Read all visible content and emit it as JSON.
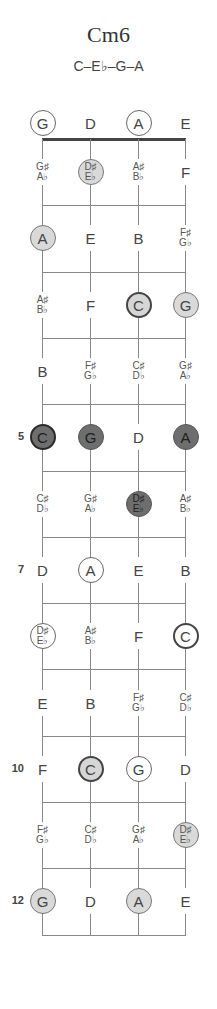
{
  "chord": {
    "name": "Cm6",
    "notes": "C–E♭–G–A"
  },
  "layout": {
    "string_x": [
      42,
      90,
      138,
      185
    ],
    "nut_y": 139,
    "fret_spacing": 66.3,
    "open_y": 123,
    "frets": 12
  },
  "colors": {
    "light_marker": "#d9d9d9",
    "dark_marker": "#6e6e6e",
    "line": "#888888",
    "nut": "#444444"
  },
  "fret_markers": [
    {
      "fret": 5,
      "label": "5"
    },
    {
      "fret": 7,
      "label": "7"
    },
    {
      "fret": 10,
      "label": "10"
    },
    {
      "fret": 12,
      "label": "12"
    }
  ],
  "rows": [
    {
      "fret": 0,
      "cells": [
        {
          "top": "G",
          "style": "open-ring"
        },
        {
          "top": "D",
          "style": "plain"
        },
        {
          "top": "A",
          "style": "open-ring"
        },
        {
          "top": "E",
          "style": "plain"
        }
      ]
    },
    {
      "fret": 1,
      "cells": [
        {
          "top": "G♯",
          "bottom": "A♭",
          "style": "plain"
        },
        {
          "top": "D♯",
          "bottom": "E♭",
          "style": "light"
        },
        {
          "top": "A♯",
          "bottom": "B♭",
          "style": "plain"
        },
        {
          "top": "F",
          "style": "plain"
        }
      ]
    },
    {
      "fret": 2,
      "cells": [
        {
          "top": "A",
          "style": "light"
        },
        {
          "top": "E",
          "style": "plain"
        },
        {
          "top": "B",
          "style": "plain"
        },
        {
          "top": "F♯",
          "bottom": "G♭",
          "style": "plain"
        }
      ]
    },
    {
      "fret": 3,
      "cells": [
        {
          "top": "A♯",
          "bottom": "B♭",
          "style": "plain"
        },
        {
          "top": "F",
          "style": "plain"
        },
        {
          "top": "C",
          "style": "light-bold"
        },
        {
          "top": "G",
          "style": "light"
        }
      ]
    },
    {
      "fret": 4,
      "cells": [
        {
          "top": "B",
          "style": "plain"
        },
        {
          "top": "F♯",
          "bottom": "G♭",
          "style": "plain"
        },
        {
          "top": "C♯",
          "bottom": "D♭",
          "style": "plain"
        },
        {
          "top": "G♯",
          "bottom": "A♭",
          "style": "plain"
        }
      ]
    },
    {
      "fret": 5,
      "cells": [
        {
          "top": "C",
          "style": "dark-bold"
        },
        {
          "top": "G",
          "style": "dark"
        },
        {
          "top": "D",
          "style": "plain"
        },
        {
          "top": "A",
          "style": "dark"
        }
      ]
    },
    {
      "fret": 6,
      "cells": [
        {
          "top": "C♯",
          "bottom": "D♭",
          "style": "plain"
        },
        {
          "top": "G♯",
          "bottom": "A♭",
          "style": "plain"
        },
        {
          "top": "D♯",
          "bottom": "E♭",
          "style": "dark"
        },
        {
          "top": "A♯",
          "bottom": "B♭",
          "style": "plain"
        }
      ]
    },
    {
      "fret": 7,
      "cells": [
        {
          "top": "D",
          "style": "plain"
        },
        {
          "top": "A",
          "style": "open-ring"
        },
        {
          "top": "E",
          "style": "plain"
        },
        {
          "top": "B",
          "style": "plain"
        }
      ]
    },
    {
      "fret": 8,
      "cells": [
        {
          "top": "D♯",
          "bottom": "E♭",
          "style": "open-ring"
        },
        {
          "top": "A♯",
          "bottom": "B♭",
          "style": "plain"
        },
        {
          "top": "F",
          "style": "plain"
        },
        {
          "top": "C",
          "style": "outline-bold"
        }
      ]
    },
    {
      "fret": 9,
      "cells": [
        {
          "top": "E",
          "style": "plain"
        },
        {
          "top": "B",
          "style": "plain"
        },
        {
          "top": "F♯",
          "bottom": "G♭",
          "style": "plain"
        },
        {
          "top": "C♯",
          "bottom": "D♭",
          "style": "plain"
        }
      ]
    },
    {
      "fret": 10,
      "cells": [
        {
          "top": "F",
          "style": "plain"
        },
        {
          "top": "C",
          "style": "light-bold"
        },
        {
          "top": "G",
          "style": "open-ring"
        },
        {
          "top": "D",
          "style": "plain"
        }
      ]
    },
    {
      "fret": 11,
      "cells": [
        {
          "top": "F♯",
          "bottom": "G♭",
          "style": "plain"
        },
        {
          "top": "C♯",
          "bottom": "D♭",
          "style": "plain"
        },
        {
          "top": "G♯",
          "bottom": "A♭",
          "style": "plain"
        },
        {
          "top": "D♯",
          "bottom": "E♭",
          "style": "light"
        }
      ]
    },
    {
      "fret": 12,
      "cells": [
        {
          "top": "G",
          "style": "light"
        },
        {
          "top": "D",
          "style": "plain"
        },
        {
          "top": "A",
          "style": "light"
        },
        {
          "top": "E",
          "style": "plain"
        }
      ]
    }
  ]
}
